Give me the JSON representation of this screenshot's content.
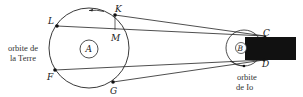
{
  "diagram": {
    "earth_orbit": {
      "caption_line1": "orbite de",
      "caption_line2": "la Terre",
      "center_label": "A"
    },
    "io_orbit": {
      "caption_line1": "orbite",
      "caption_line2": "de Io",
      "center_label": "B"
    },
    "points": {
      "L": "L",
      "K": "K",
      "M": "M",
      "F": "F",
      "G": "G",
      "C": "C",
      "D": "D"
    },
    "colors": {
      "stroke": "#222222",
      "shadow": "#111111",
      "background": "#ffffff"
    }
  }
}
